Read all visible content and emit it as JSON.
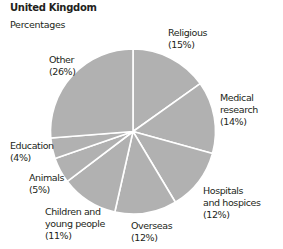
{
  "chart_data": {
    "type": "pie",
    "title": "United Kingdom",
    "subtitle": "Percentages",
    "start_angle": "12 o'clock",
    "direction": "clockwise",
    "slice_color": "#b1b1b1",
    "divider_color": "#ffffff",
    "slices": [
      {
        "label_lines": [
          "Religious",
          "(15%)"
        ],
        "name": "Religious",
        "value": 15
      },
      {
        "label_lines": [
          "Medical",
          "research",
          "(14%)"
        ],
        "name": "Medical research",
        "value": 14
      },
      {
        "label_lines": [
          "Hospitals",
          "and hospices",
          "(12%)"
        ],
        "name": "Hospitals and hospices",
        "value": 12
      },
      {
        "label_lines": [
          "Overseas",
          "(12%)"
        ],
        "name": "Overseas",
        "value": 12
      },
      {
        "label_lines": [
          "Children and",
          "young people",
          "(11%)"
        ],
        "name": "Children and young people",
        "value": 11
      },
      {
        "label_lines": [
          "Animals",
          "(5%)"
        ],
        "name": "Animals",
        "value": 5
      },
      {
        "label_lines": [
          "Education",
          "(4%)"
        ],
        "name": "Education",
        "value": 4
      },
      {
        "label_lines": [
          "Other",
          "(26%)"
        ],
        "name": "Other",
        "value": 26
      }
    ]
  }
}
